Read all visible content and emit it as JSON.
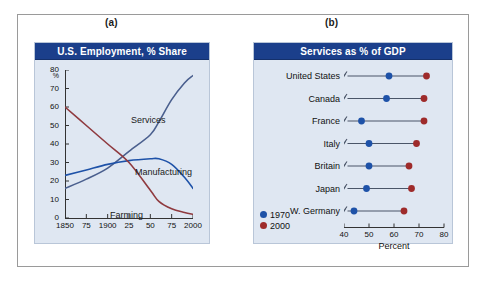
{
  "figure": {
    "panel_a_label": "(a)",
    "panel_b_label": "(b)"
  },
  "colors": {
    "title_bar": "#1b3f8b",
    "card_background": "#dfe7f2",
    "services_line": "#4a5f8e",
    "manufacturing_line": "#1e52a8",
    "farming_line": "#8f3a3f",
    "dot_1970": "#1e52a8",
    "dot_2000": "#9e2b2b",
    "frame": "#9a9a9a"
  },
  "panel_a": {
    "title": "U.S. Employment, % Share",
    "y_unit": "%",
    "y_ticks": [
      "0",
      "10",
      "20",
      "30",
      "40",
      "50",
      "60",
      "70",
      "80"
    ],
    "x_ticks": [
      "1850",
      "75",
      "1900",
      "25",
      "50",
      "75",
      "2000"
    ],
    "series_labels": {
      "services": "Services",
      "manufacturing": "Manufacturing",
      "farming": "Farming"
    }
  },
  "panel_b": {
    "title": "Services as % of GDP",
    "x_axis_label": "Percent",
    "x_ticks": [
      "40",
      "50",
      "60",
      "70",
      "80"
    ],
    "legend": [
      {
        "label": "1970",
        "color": "#1e52a8"
      },
      {
        "label": "2000",
        "color": "#9e2b2b"
      }
    ],
    "countries": [
      "United States",
      "Canada",
      "France",
      "Italy",
      "Britain",
      "Japan",
      "W. Germany"
    ]
  },
  "chart_data": [
    {
      "type": "line",
      "title": "U.S. Employment, % Share",
      "xlabel": "",
      "ylabel": "%",
      "xlim": [
        1850,
        2000
      ],
      "ylim": [
        0,
        80
      ],
      "xticks": [
        1850,
        1875,
        1900,
        1925,
        1950,
        1975,
        2000
      ],
      "xticklabels": [
        "1850",
        "75",
        "1900",
        "25",
        "50",
        "75",
        "2000"
      ],
      "yticks": [
        0,
        10,
        20,
        30,
        40,
        50,
        60,
        70,
        80
      ],
      "grid": false,
      "legend": "inline-annotations",
      "x": [
        1850,
        1875,
        1900,
        1925,
        1950,
        1960,
        1975,
        1990,
        2000
      ],
      "series": [
        {
          "name": "Services",
          "color": "#4a5f8e",
          "values": [
            16,
            21,
            27,
            36,
            45,
            52,
            64,
            73,
            77
          ]
        },
        {
          "name": "Manufacturing",
          "color": "#1e52a8",
          "values": [
            23,
            26,
            29,
            31,
            32,
            32,
            29,
            22,
            16
          ]
        },
        {
          "name": "Farming",
          "color": "#8f3a3f",
          "values": [
            60,
            50,
            40,
            30,
            15,
            9,
            5,
            3,
            2
          ]
        }
      ]
    },
    {
      "type": "scatter",
      "subtype": "dumbbell",
      "title": "Services as % of GDP",
      "xlabel": "Percent",
      "ylabel": "",
      "xlim": [
        40,
        80
      ],
      "xticks": [
        40,
        50,
        60,
        70,
        80
      ],
      "xticklabels": [
        "40",
        "50",
        "60",
        "70",
        "80"
      ],
      "axis_break": true,
      "grid": false,
      "legend_position": "bottom-left",
      "categories": [
        "United States",
        "Canada",
        "France",
        "Italy",
        "Britain",
        "Japan",
        "W. Germany"
      ],
      "series": [
        {
          "name": "1970",
          "color": "#1e52a8",
          "values": [
            58,
            57,
            47,
            50,
            50,
            49,
            44
          ]
        },
        {
          "name": "2000",
          "color": "#9e2b2b",
          "values": [
            73,
            72,
            72,
            69,
            66,
            67,
            64
          ]
        }
      ]
    }
  ]
}
